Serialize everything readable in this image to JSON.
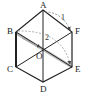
{
  "diagram": {
    "points": {
      "A": {
        "label": "A",
        "x": 43,
        "y": 10
      },
      "B": {
        "label": "B",
        "x": 16,
        "y": 32
      },
      "C": {
        "label": "C",
        "x": 16,
        "y": 67
      },
      "D": {
        "label": "D",
        "x": 43,
        "y": 82
      },
      "E": {
        "label": "E",
        "x": 72,
        "y": 67
      },
      "F": {
        "label": "F",
        "x": 72,
        "y": 32
      },
      "O": {
        "label": "O",
        "x": 43,
        "y": 48
      }
    },
    "arrows": [
      {
        "label": "1",
        "from": "A",
        "to": "F",
        "style": "dashed-curve"
      },
      {
        "label": "2",
        "from": "B",
        "to": "E",
        "style": "dashed-curve"
      }
    ],
    "colors": {
      "stroke": "#222222",
      "dashed": "#888888",
      "highlight": "#bbbbbb"
    }
  }
}
